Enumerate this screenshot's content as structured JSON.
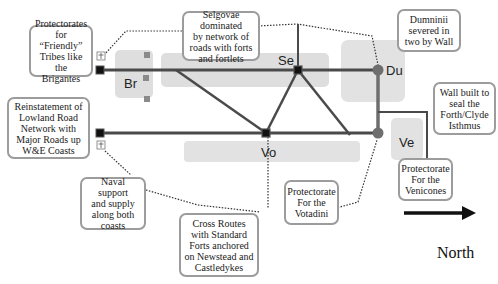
{
  "diagram": {
    "regions": [
      {
        "id": "br",
        "label": "Br",
        "name": "Brigantes"
      },
      {
        "id": "se",
        "label": "Se",
        "name": "Selgovae"
      },
      {
        "id": "du",
        "label": "Du",
        "name": "Dumninii"
      },
      {
        "id": "vo",
        "label": "Vo",
        "name": "Votadini"
      },
      {
        "id": "ve",
        "label": "Ve",
        "name": "Venicones"
      }
    ],
    "callouts": {
      "protectorates_friendly": "Protectorates\nfor “Friendly”\nTribes like the\nBrigantes",
      "reinstatement": "Reinstatement of\nLowland Road\nNetwork with\nMajor Roads up\nW&E Coasts",
      "naval": "Naval support\nand supply\nalong both\ncoasts",
      "cross_routes": "Cross Routes\nwith Standard\nForts anchored\non Newstead and\nCastledykes",
      "selgovae": "Selgovae dominated\nby network of\nroads with forts\nand fortlets",
      "votadini": "Protectorate\nFor the\nVotadini",
      "dumninii": "Dumninii\nsevered in\ntwo by Wall",
      "wall": "Wall built to\nseal the\nForth/Clyde\nIsthmus",
      "venicones": "Protectorate\nFor the\nVenicones"
    },
    "compass": {
      "label": "North",
      "icon": "arrow-right-icon"
    },
    "icons": {
      "fort": "fort-square-icon",
      "anchor": "anchor-icon",
      "wall_end": "wall-terminus-circle-icon",
      "fortlet": "fortlet-square-icon"
    },
    "colors": {
      "road": "#4a4a4a",
      "region_fill": "#dedede",
      "callout_border": "#9c9c9c",
      "wall_circle": "#6e6e6e",
      "fort_fill": "#111111",
      "fortlet": "#8a8a8a"
    }
  }
}
